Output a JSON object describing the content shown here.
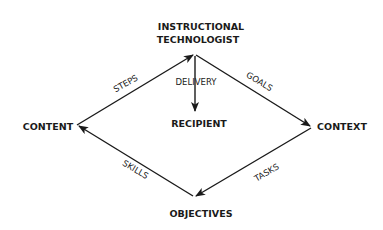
{
  "diagram": {
    "nodes": {
      "top_line1": "INSTRUCTIONAL",
      "top_line2": "TECHNOLOGIST",
      "left": "CONTENT",
      "right": "CONTEXT",
      "bottom": "OBJECTIVES",
      "center": "RECIPIENT"
    },
    "edges": {
      "content_to_technologist": "STEPS",
      "technologist_to_context": "GOALS",
      "context_to_objectives": "TASKS",
      "objectives_to_content": "SKILLS",
      "technologist_to_recipient": "DELIVERY"
    },
    "colors": {
      "ink": "#1a1a1a",
      "background": "#ffffff"
    }
  }
}
